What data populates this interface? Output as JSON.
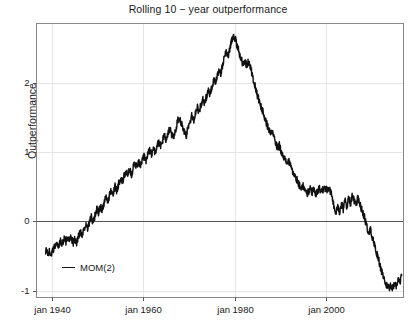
{
  "chart_data": {
    "type": "line",
    "title": "Rolling 10 − year outperformance",
    "xlabel": "",
    "ylabel": "Outperformance",
    "grid": true,
    "legend_position": "bottom-left",
    "xtick_labels": [
      "jan 1940",
      "jan 1960",
      "jan 1980",
      "jan 2000"
    ],
    "xtick_values": [
      1940,
      1960,
      1980,
      2000
    ],
    "ytick_labels": [
      "2",
      "1",
      "0",
      "-1"
    ],
    "ytick_values": [
      2,
      1,
      0,
      -1
    ],
    "xlim": [
      1936.6,
      2017.0
    ],
    "ylim": [
      -1.1,
      2.86
    ],
    "zero_line": 0,
    "series": [
      {
        "name": "MOM(2)",
        "color": "#111111",
        "x": [
          1938.6,
          1939.0,
          1939.4,
          1939.8,
          1940.2,
          1940.6,
          1941.0,
          1941.4,
          1941.8,
          1942.2,
          1942.6,
          1943.0,
          1943.4,
          1943.8,
          1944.2,
          1944.6,
          1945.0,
          1945.4,
          1945.8,
          1946.2,
          1946.6,
          1947.0,
          1947.4,
          1947.8,
          1948.2,
          1948.6,
          1949.0,
          1949.4,
          1949.8,
          1950.2,
          1950.6,
          1951.0,
          1951.4,
          1951.8,
          1952.2,
          1952.6,
          1953.0,
          1953.4,
          1953.8,
          1954.2,
          1954.6,
          1955.0,
          1955.4,
          1955.8,
          1956.2,
          1956.6,
          1957.0,
          1957.4,
          1957.8,
          1958.2,
          1958.6,
          1959.0,
          1959.4,
          1959.8,
          1960.2,
          1960.6,
          1961.0,
          1961.4,
          1961.8,
          1962.2,
          1962.6,
          1963.0,
          1963.4,
          1963.8,
          1964.2,
          1964.6,
          1965.0,
          1965.4,
          1965.8,
          1966.2,
          1966.6,
          1967.0,
          1967.4,
          1967.8,
          1968.2,
          1968.6,
          1969.0,
          1969.4,
          1969.8,
          1970.2,
          1970.6,
          1971.0,
          1971.4,
          1971.8,
          1972.2,
          1972.6,
          1973.0,
          1973.4,
          1973.8,
          1974.2,
          1974.6,
          1975.0,
          1975.4,
          1975.8,
          1976.2,
          1976.6,
          1977.0,
          1977.4,
          1977.8,
          1978.2,
          1978.6,
          1979.0,
          1979.4,
          1979.8,
          1980.2,
          1980.6,
          1981.0,
          1981.4,
          1981.8,
          1982.2,
          1982.6,
          1983.0,
          1983.4,
          1983.8,
          1984.2,
          1984.6,
          1985.0,
          1985.4,
          1985.8,
          1986.2,
          1986.6,
          1987.0,
          1987.4,
          1987.8,
          1988.2,
          1988.6,
          1989.0,
          1989.4,
          1989.8,
          1990.2,
          1990.6,
          1991.0,
          1991.4,
          1991.8,
          1992.2,
          1992.6,
          1993.0,
          1993.4,
          1993.8,
          1994.2,
          1994.6,
          1995.0,
          1995.4,
          1995.8,
          1996.2,
          1996.6,
          1997.0,
          1997.4,
          1997.8,
          1998.2,
          1998.6,
          1999.0,
          1999.4,
          1999.8,
          2000.2,
          2000.6,
          2001.0,
          2001.4,
          2001.8,
          2002.2,
          2002.6,
          2003.0,
          2003.4,
          2003.8,
          2004.2,
          2004.6,
          2005.0,
          2005.4,
          2005.8,
          2006.2,
          2006.6,
          2007.0,
          2007.4,
          2007.8,
          2008.2,
          2008.6,
          2009.0,
          2009.4,
          2009.8,
          2010.2,
          2010.6,
          2011.0,
          2011.4,
          2011.8,
          2012.2,
          2012.6,
          2013.0,
          2013.4,
          2013.8,
          2014.2,
          2014.6,
          2015.0,
          2015.4,
          2015.8,
          2016.2,
          2016.6
        ],
        "y": [
          -0.42,
          -0.45,
          -0.44,
          -0.47,
          -0.43,
          -0.36,
          -0.3,
          -0.37,
          -0.28,
          -0.33,
          -0.25,
          -0.3,
          -0.22,
          -0.28,
          -0.24,
          -0.31,
          -0.26,
          -0.3,
          -0.22,
          -0.15,
          -0.19,
          -0.1,
          -0.05,
          -0.12,
          -0.02,
          0.06,
          -0.02,
          0.08,
          0.18,
          0.12,
          0.22,
          0.16,
          0.26,
          0.34,
          0.28,
          0.38,
          0.46,
          0.4,
          0.5,
          0.44,
          0.55,
          0.62,
          0.56,
          0.65,
          0.72,
          0.66,
          0.74,
          0.68,
          0.78,
          0.84,
          0.78,
          0.86,
          0.8,
          0.88,
          0.95,
          0.88,
          0.97,
          1.04,
          0.97,
          1.06,
          1.0,
          1.09,
          1.16,
          1.08,
          1.17,
          1.24,
          1.17,
          1.26,
          1.34,
          1.26,
          1.22,
          1.3,
          1.42,
          1.52,
          1.44,
          1.36,
          1.28,
          1.24,
          1.34,
          1.44,
          1.52,
          1.46,
          1.56,
          1.66,
          1.58,
          1.68,
          1.76,
          1.7,
          1.8,
          1.9,
          1.84,
          1.94,
          2.04,
          1.98,
          2.1,
          2.2,
          2.14,
          2.26,
          2.38,
          2.46,
          2.4,
          2.52,
          2.62,
          2.7,
          2.62,
          2.52,
          2.44,
          2.36,
          2.28,
          2.32,
          2.26,
          2.3,
          2.26,
          2.14,
          2.02,
          1.92,
          1.82,
          1.74,
          1.66,
          1.58,
          1.5,
          1.42,
          1.34,
          1.26,
          1.3,
          1.22,
          1.14,
          1.06,
          1.1,
          1.02,
          0.96,
          0.9,
          0.84,
          0.88,
          0.8,
          0.74,
          0.68,
          0.64,
          0.58,
          0.52,
          0.48,
          0.52,
          0.44,
          0.4,
          0.44,
          0.48,
          0.42,
          0.46,
          0.4,
          0.44,
          0.48,
          0.42,
          0.46,
          0.5,
          0.44,
          0.48,
          0.42,
          0.36,
          0.2,
          0.1,
          0.22,
          0.14,
          0.26,
          0.18,
          0.3,
          0.22,
          0.34,
          0.26,
          0.38,
          0.3,
          0.22,
          0.34,
          0.26,
          0.18,
          0.1,
          0.02,
          -0.08,
          -0.18,
          -0.12,
          -0.24,
          -0.34,
          -0.44,
          -0.52,
          -0.62,
          -0.72,
          -0.8,
          -0.88,
          -0.94,
          -0.98,
          -0.92,
          -0.96,
          -0.9,
          -0.94,
          -0.84,
          -0.88,
          -0.78
        ]
      }
    ]
  },
  "legend": {
    "entries": [
      {
        "label": "MOM(2)",
        "color": "#111111"
      }
    ]
  }
}
